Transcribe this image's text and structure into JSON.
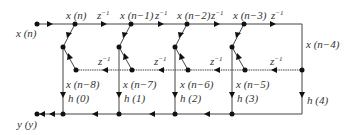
{
  "diagram": {
    "input_label": "x (n)",
    "output_label": "y (y)",
    "top_taps": [
      "x (n)",
      "x (n−1)",
      "x (n−2)",
      "x (n−3)"
    ],
    "right_label": "x (n−4)",
    "bottom_taps": [
      "x (n−8)",
      "x (n−7)",
      "x (n−6)",
      "x (n−5)"
    ],
    "delay_label": "z",
    "delay_exp": "−1",
    "coefficients": [
      "h (0)",
      "h (1)",
      "h (2)",
      "h (3)",
      "h (4)"
    ]
  }
}
